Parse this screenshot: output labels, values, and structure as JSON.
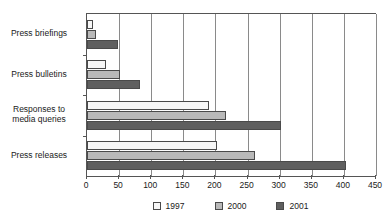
{
  "chart_data": {
    "type": "bar",
    "orientation": "horizontal",
    "title": "",
    "xlabel": "",
    "ylabel": "",
    "categories": [
      "Press briefings",
      "Press bulletins",
      "Responses to\nmedia queries",
      "Press releases"
    ],
    "series": [
      {
        "name": "1997",
        "color": "#f7f7f7",
        "values": [
          10,
          30,
          190,
          202
        ]
      },
      {
        "name": "2000",
        "color": "#b9b9b9",
        "values": [
          14,
          51,
          216,
          261
        ]
      },
      {
        "name": "2001",
        "color": "#5f5f5f",
        "values": [
          48,
          82,
          302,
          403
        ]
      }
    ],
    "xlim": [
      0,
      450
    ],
    "xticks": [
      0,
      50,
      100,
      150,
      200,
      250,
      300,
      350,
      400,
      450
    ],
    "xtick_labels": [
      "0",
      "50",
      "100",
      "150",
      "200",
      "250",
      "300",
      "350",
      "400",
      "450"
    ],
    "grid": true,
    "grid_axis": "x",
    "legend_position": "bottom"
  },
  "legend": {
    "items": [
      {
        "label": "1997"
      },
      {
        "label": "2000"
      },
      {
        "label": "2001"
      }
    ]
  }
}
